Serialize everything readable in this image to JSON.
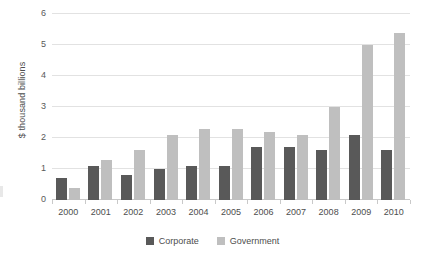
{
  "chart_data": {
    "type": "bar",
    "title": "",
    "xlabel": "",
    "ylabel": "$ thousand billions",
    "ylim": [
      0,
      6
    ],
    "yticks": [
      0,
      1,
      2,
      3,
      4,
      5,
      6
    ],
    "ytick_labels": [
      "0",
      "1",
      "2",
      "3",
      "4",
      "5",
      "6"
    ],
    "grid": true,
    "legend_position": "bottom",
    "categories": [
      "2000",
      "2001",
      "2002",
      "2003",
      "2004",
      "2005",
      "2006",
      "2007",
      "2008",
      "2009",
      "2010"
    ],
    "series": [
      {
        "name": "Corporate",
        "color": "#595959",
        "values": [
          0.72,
          1.1,
          0.82,
          1.0,
          1.1,
          1.1,
          1.7,
          1.7,
          1.6,
          2.1,
          1.6
        ]
      },
      {
        "name": "Government",
        "color": "#bfbfbf",
        "values": [
          0.4,
          1.3,
          1.6,
          2.1,
          2.3,
          2.3,
          2.2,
          2.1,
          3.0,
          5.0,
          5.4
        ]
      }
    ]
  }
}
